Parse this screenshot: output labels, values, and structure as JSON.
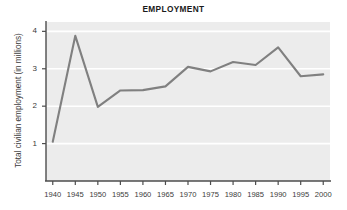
{
  "chart_data": {
    "type": "line",
    "title": "EMPLOYMENT",
    "xlabel": "",
    "ylabel": "Total civilian employment (in millions)",
    "x": [
      1940,
      1945,
      1950,
      1955,
      1960,
      1965,
      1970,
      1975,
      1980,
      1985,
      1990,
      1995,
      2000
    ],
    "values": [
      1.05,
      3.88,
      1.98,
      2.42,
      2.43,
      2.53,
      3.05,
      2.93,
      3.18,
      3.1,
      3.57,
      2.8,
      2.85
    ],
    "series": [
      {
        "name": "Total civilian employment",
        "values": [
          1.05,
          3.88,
          1.98,
          2.42,
          2.43,
          2.53,
          3.05,
          2.93,
          3.18,
          3.1,
          3.57,
          2.8,
          2.85
        ]
      }
    ],
    "xtick_labels": [
      "1940",
      "1945",
      "1950",
      "1955",
      "1960",
      "1965",
      "1970",
      "1975",
      "1980",
      "1985",
      "1990",
      "1995",
      "2000"
    ],
    "ytick_labels": [
      "1",
      "2",
      "3",
      "4"
    ],
    "ytick_values": [
      1,
      2,
      3,
      4
    ],
    "xlim": [
      1938.5,
      2001.5
    ],
    "ylim": [
      0,
      4.25
    ],
    "grid": "horizontal-white",
    "legend": "none",
    "colors": {
      "line": "#808080",
      "plot_background": "#ececec",
      "gridline": "#ffffff",
      "axis": "#4d4d4d",
      "text": "#3b3b3b",
      "title": "#1a1a1a"
    }
  }
}
